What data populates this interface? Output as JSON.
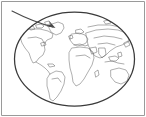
{
  "figure": {
    "title": "World map inside ellipse with pointer annotation",
    "background_color": "#ffffff",
    "width": 146,
    "height": 117
  },
  "frame": {
    "name": "figure-border",
    "color": "#9a9a9a",
    "stroke_width": 1,
    "sides_visible": [
      "top",
      "left",
      "right",
      "bottom"
    ]
  },
  "globe": {
    "shape": "ellipse",
    "label": "World map ellipse",
    "color": "#3a3a3a",
    "stroke_width": 1.25,
    "center_x": 74.5,
    "center_y": 59,
    "radius_x": 61,
    "radius_y": 48
  },
  "map": {
    "projection": "elliptical world projection",
    "land_color": "#6e6e6e",
    "fill": "none",
    "regions": [
      "North America",
      "Greenland",
      "South America",
      "Europe",
      "Africa",
      "Asia",
      "Australia",
      "Arctic islands"
    ]
  },
  "annotation": {
    "type": "arrow",
    "label": "pointer arrow",
    "color": "#4a4a4a",
    "stroke_width": 1.15,
    "start_x": 12,
    "start_y": 11,
    "end_x": 55,
    "end_y": 28,
    "points_to": "northern Europe / Greenland region"
  },
  "chart_data": {
    "type": "scatter",
    "title": "World map inside ellipse with pointer annotation",
    "xlabel": "",
    "ylabel": "",
    "annotations": [
      {
        "kind": "arrow",
        "from": [
          12,
          11
        ],
        "to": [
          55,
          28
        ],
        "target_region": "northern Europe / Greenland"
      },
      {
        "kind": "ellipse",
        "center": [
          74.5,
          59
        ],
        "radii": [
          61,
          48
        ]
      }
    ],
    "grid": false,
    "legend": "none"
  }
}
